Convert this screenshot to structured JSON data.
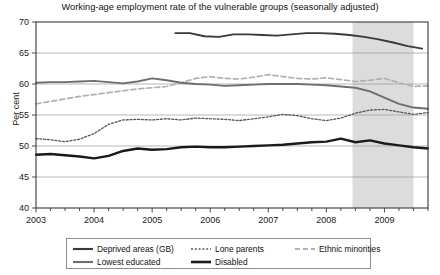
{
  "chart_data": {
    "type": "line",
    "title": "Working-age employment rate of the vulnerable groups (seasonally adjusted)",
    "xlabel": "",
    "ylabel": "Per cent",
    "ylim": [
      40,
      70
    ],
    "y_ticks": [
      40,
      45,
      50,
      55,
      60,
      65,
      70
    ],
    "xlim": [
      2003.0,
      2009.75
    ],
    "x_ticks": [
      2003,
      2004,
      2005,
      2006,
      2007,
      2008,
      2009
    ],
    "x_tick_labels": [
      "2003",
      "2004",
      "2005",
      "2006",
      "2007",
      "2008",
      "2009"
    ],
    "minor_x_ticks_per_year": 4,
    "grid": "horizontal",
    "legend_position": "below-axes",
    "shaded_region": {
      "label": "recession",
      "x_start": 2008.45,
      "x_end": 2009.5,
      "color": "#dcdcdc"
    },
    "series": [
      {
        "name": "Deprived areas (GB)",
        "color": "#3a3a3a",
        "style": "solid",
        "width": 1.9,
        "x": [
          2005.4,
          2005.65,
          2005.9,
          2006.15,
          2006.4,
          2006.65,
          2006.9,
          2007.15,
          2007.4,
          2007.65,
          2007.9,
          2008.15,
          2008.4,
          2008.65,
          2008.9,
          2009.15,
          2009.4,
          2009.65
        ],
        "values": [
          68.2,
          68.2,
          67.7,
          67.6,
          68.0,
          68.0,
          67.9,
          67.8,
          68.0,
          68.2,
          68.2,
          68.1,
          67.9,
          67.6,
          67.2,
          66.7,
          66.1,
          65.7
        ]
      },
      {
        "name": "Lone parents",
        "color": "#555555",
        "style": "dotted",
        "width": 1.3,
        "x": [
          2003.0,
          2003.25,
          2003.5,
          2003.75,
          2004.0,
          2004.25,
          2004.5,
          2004.75,
          2005.0,
          2005.25,
          2005.5,
          2005.75,
          2006.0,
          2006.25,
          2006.5,
          2006.75,
          2007.0,
          2007.25,
          2007.5,
          2007.75,
          2008.0,
          2008.25,
          2008.5,
          2008.75,
          2009.0,
          2009.25,
          2009.5,
          2009.75
        ],
        "values": [
          51.2,
          51.0,
          50.7,
          51.1,
          52.0,
          53.5,
          54.2,
          54.3,
          54.2,
          54.4,
          54.2,
          54.5,
          54.4,
          54.3,
          54.1,
          54.4,
          54.7,
          55.1,
          54.9,
          54.4,
          54.1,
          54.5,
          55.3,
          55.8,
          55.9,
          55.5,
          55.1,
          55.4
        ]
      },
      {
        "name": "Ethnic minorities",
        "color": "#b0b0b0",
        "style": "dashed",
        "width": 1.7,
        "x": [
          2003.0,
          2003.25,
          2003.5,
          2003.75,
          2004.0,
          2004.25,
          2004.5,
          2004.75,
          2005.0,
          2005.25,
          2005.5,
          2005.75,
          2006.0,
          2006.25,
          2006.5,
          2006.75,
          2007.0,
          2007.25,
          2007.5,
          2007.75,
          2008.0,
          2008.25,
          2008.5,
          2008.75,
          2009.0,
          2009.25,
          2009.5,
          2009.75
        ],
        "values": [
          56.8,
          57.2,
          57.6,
          58.0,
          58.3,
          58.6,
          58.9,
          59.2,
          59.4,
          59.6,
          60.2,
          60.9,
          61.2,
          60.9,
          60.8,
          61.1,
          61.5,
          61.2,
          60.9,
          60.8,
          61.0,
          60.7,
          60.4,
          60.6,
          60.9,
          60.2,
          59.6,
          59.7
        ]
      },
      {
        "name": "Lowest educated",
        "color": "#6e6e6e",
        "style": "solid",
        "width": 1.9,
        "x": [
          2003.0,
          2003.25,
          2003.5,
          2003.75,
          2004.0,
          2004.25,
          2004.5,
          2004.75,
          2005.0,
          2005.25,
          2005.5,
          2005.75,
          2006.0,
          2006.25,
          2006.5,
          2006.75,
          2007.0,
          2007.25,
          2007.5,
          2007.75,
          2008.0,
          2008.25,
          2008.5,
          2008.75,
          2009.0,
          2009.25,
          2009.5,
          2009.75
        ],
        "values": [
          60.2,
          60.3,
          60.3,
          60.4,
          60.5,
          60.3,
          60.1,
          60.4,
          60.9,
          60.6,
          60.2,
          60.0,
          59.9,
          59.7,
          59.8,
          59.9,
          60.0,
          60.0,
          60.0,
          59.9,
          59.8,
          59.6,
          59.4,
          58.8,
          57.8,
          56.8,
          56.2,
          56.0
        ]
      },
      {
        "name": "Disabled",
        "color": "#1a1a1a",
        "style": "solid",
        "width": 2.4,
        "x": [
          2003.0,
          2003.25,
          2003.5,
          2003.75,
          2004.0,
          2004.25,
          2004.5,
          2004.75,
          2005.0,
          2005.25,
          2005.5,
          2005.75,
          2006.0,
          2006.25,
          2006.5,
          2006.75,
          2007.0,
          2007.25,
          2007.5,
          2007.75,
          2008.0,
          2008.25,
          2008.5,
          2008.75,
          2009.0,
          2009.25,
          2009.5,
          2009.75
        ],
        "values": [
          48.6,
          48.7,
          48.5,
          48.3,
          48.0,
          48.4,
          49.2,
          49.6,
          49.4,
          49.5,
          49.8,
          49.9,
          49.8,
          49.8,
          49.9,
          50.0,
          50.1,
          50.2,
          50.4,
          50.6,
          50.7,
          51.2,
          50.6,
          50.9,
          50.4,
          50.1,
          49.8,
          49.6
        ]
      }
    ]
  },
  "legend": {
    "rows": [
      [
        {
          "label": "Deprived areas (GB)",
          "series": 0
        },
        {
          "label": "Lone parents",
          "series": 1
        },
        {
          "label": "Ethnic minorities",
          "series": 2
        }
      ],
      [
        {
          "label": "Lowest educated",
          "series": 3
        },
        {
          "label": "Disabled",
          "series": 4
        }
      ]
    ]
  }
}
